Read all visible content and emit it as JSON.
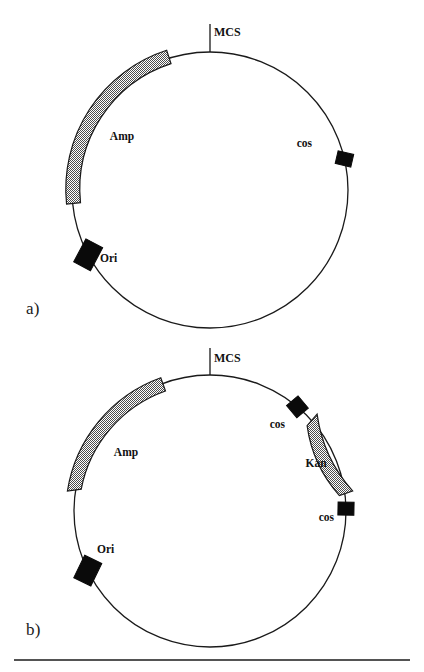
{
  "figure": {
    "type": "vector-map-diagram",
    "panels": [
      {
        "id": "a",
        "panel_label": "a)",
        "panel_label_x": 26,
        "panel_label_y": 299,
        "circle": {
          "cx": 210,
          "cy": 190,
          "r": 138
        },
        "features": [
          {
            "name": "MCS",
            "kind": "tick",
            "label": "MCS",
            "angle_deg": 90,
            "tick_length": 28,
            "label_x": 214,
            "label_y": 36,
            "anchor": "start"
          },
          {
            "name": "Amp",
            "kind": "arc",
            "label": "Amp",
            "start_angle_deg": 107,
            "end_angle_deg": 175,
            "band_width": 14,
            "band_offset": 8,
            "fill": "stipple",
            "label_x": 122,
            "label_y": 140,
            "anchor": "middle"
          },
          {
            "name": "cos",
            "kind": "box",
            "label": "cos",
            "angle_deg": 13,
            "box_w": 16,
            "box_h": 13,
            "fill": "#0a0a0a",
            "label_x": 312,
            "label_y": 147,
            "anchor": "end"
          },
          {
            "name": "Ori",
            "kind": "box",
            "label": "Ori",
            "angle_deg": 208,
            "box_w": 19,
            "box_h": 26,
            "fill": "#0a0a0a",
            "label_x": 100,
            "label_y": 262,
            "anchor": "start"
          }
        ]
      },
      {
        "id": "b",
        "panel_label": "b)",
        "panel_label_x": 26,
        "panel_label_y": 620,
        "circle": {
          "cx": 210,
          "cy": 511,
          "r": 136
        },
        "features": [
          {
            "name": "MCS",
            "kind": "tick",
            "label": "MCS",
            "angle_deg": 90,
            "tick_length": 27,
            "label_x": 214,
            "label_y": 362,
            "anchor": "start"
          },
          {
            "name": "Amp",
            "kind": "arc",
            "label": "Amp",
            "start_angle_deg": 110,
            "end_angle_deg": 172,
            "band_width": 14,
            "band_offset": 8,
            "fill": "stipple",
            "label_x": 126,
            "label_y": 456,
            "anchor": "middle"
          },
          {
            "name": "cos-upper",
            "kind": "box",
            "label": "cos",
            "angle_deg": 50,
            "box_w": 16,
            "box_h": 15,
            "fill": "#0a0a0a",
            "label_x": 285,
            "label_y": 428,
            "anchor": "end"
          },
          {
            "name": "Kan",
            "kind": "arc",
            "label": "Kan",
            "start_angle_deg": 8,
            "end_angle_deg": 42,
            "band_width": 13,
            "band_offset": 8,
            "fill": "stipple",
            "label_x": 316,
            "label_y": 467,
            "anchor": "middle"
          },
          {
            "name": "cos-lower",
            "kind": "box",
            "label": "cos",
            "angle_deg": 1,
            "box_w": 16,
            "box_h": 13,
            "fill": "#0a0a0a",
            "label_x": 334,
            "label_y": 521,
            "anchor": "end"
          },
          {
            "name": "Ori",
            "kind": "box",
            "label": "Ori",
            "angle_deg": 206,
            "box_w": 19,
            "box_h": 25,
            "fill": "#0a0a0a",
            "label_x": 97,
            "label_y": 553,
            "anchor": "start"
          }
        ]
      }
    ],
    "footer_rule": {
      "x1": 14,
      "x2": 410,
      "y": 660
    },
    "colors": {
      "line": "#1a1a1a",
      "marker_fill": "#0a0a0a",
      "stipple_fill": "#9a9a9a",
      "background": "#ffffff"
    }
  }
}
